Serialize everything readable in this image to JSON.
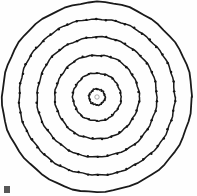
{
  "figure": {
    "caption": "Six concentric circular rings with discrete node markers distributed along each ring circumference.",
    "background_color": "#fefefe",
    "stroke_color": "#1a1a1a",
    "node_color": "#141414",
    "center_mark_color": "#8a8a8a",
    "width_px": 197,
    "height_px": 196,
    "center_x_px": 97,
    "center_y_px": 97,
    "corner_artifact_label": "scan artifact mark"
  },
  "chart_data": {
    "type": "scatter",
    "subtitle": "",
    "xlabel": "",
    "ylabel": "",
    "grid": false,
    "legend_position": "none",
    "axis_visible": false,
    "xlim": [
      -97,
      100
    ],
    "ylim": [
      -97,
      99
    ],
    "center": [
      97,
      97
    ],
    "coordinate_system": "polar",
    "ring_count": 6,
    "rings": [
      {
        "index": 1,
        "name": "ring-1-innermost",
        "radius_px": 8,
        "node_count": 10,
        "stroke_width_px": 1.5,
        "node_radius_px": 1.0,
        "phase_deg": 18
      },
      {
        "index": 2,
        "name": "ring-2",
        "radius_px": 24,
        "node_count": 18,
        "stroke_width_px": 1.5,
        "node_radius_px": 1.1,
        "phase_deg": 10
      },
      {
        "index": 3,
        "name": "ring-3",
        "radius_px": 42,
        "node_count": 28,
        "stroke_width_px": 1.5,
        "node_radius_px": 1.2,
        "phase_deg": 6
      },
      {
        "index": 4,
        "name": "ring-4",
        "radius_px": 60,
        "node_count": 38,
        "stroke_width_px": 1.5,
        "node_radius_px": 1.2,
        "phase_deg": 4
      },
      {
        "index": 5,
        "name": "ring-5",
        "radius_px": 78,
        "node_count": 50,
        "stroke_width_px": 1.5,
        "node_radius_px": 1.2,
        "phase_deg": 3
      },
      {
        "index": 6,
        "name": "ring-6-outermost",
        "radius_px": 95,
        "node_count": 0,
        "stroke_width_px": 1.8,
        "node_radius_px": 0,
        "phase_deg": 0
      }
    ],
    "center_mark": {
      "name": "center-origin-mark",
      "radius_px": 2.2,
      "visible": true
    }
  }
}
